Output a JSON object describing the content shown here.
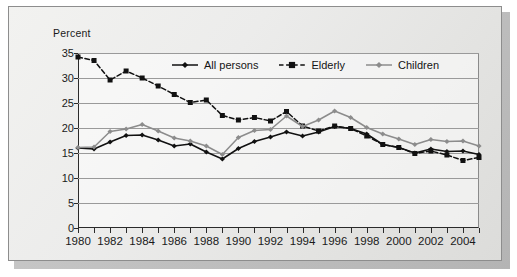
{
  "figure": {
    "y_axis_title": "Percent"
  },
  "legend": {
    "position": "top-center-inside",
    "items": [
      {
        "label": "All persons",
        "color": "#111111",
        "dash": "solid",
        "marker": "diamond"
      },
      {
        "label": "Elderly",
        "color": "#111111",
        "dash": "dashed",
        "marker": "square"
      },
      {
        "label": "Children",
        "color": "#8c8c8c",
        "dash": "solid",
        "marker": "diamond"
      }
    ]
  },
  "chart_data": {
    "type": "line",
    "title": "",
    "xlabel": "",
    "ylabel": "Percent",
    "xlim": [
      1980,
      2005
    ],
    "ylim": [
      0,
      35
    ],
    "ytick_step": 5,
    "grid": true,
    "xtick_every": 1,
    "xlabel_every": 2,
    "x": [
      1980,
      1981,
      1982,
      1983,
      1984,
      1985,
      1986,
      1987,
      1988,
      1989,
      1990,
      1991,
      1992,
      1993,
      1994,
      1995,
      1996,
      1997,
      1998,
      1999,
      2000,
      2001,
      2002,
      2003,
      2004,
      2005
    ],
    "yticks": [
      0,
      5,
      10,
      15,
      20,
      25,
      30,
      35
    ],
    "xticks": [
      1980,
      1981,
      1982,
      1983,
      1984,
      1985,
      1986,
      1987,
      1988,
      1989,
      1990,
      1991,
      1992,
      1993,
      1994,
      1995,
      1996,
      1997,
      1998,
      1999,
      2000,
      2001,
      2002,
      2003,
      2004,
      2005
    ],
    "xtick_labels": [
      "1980",
      "",
      "1982",
      "",
      "1984",
      "",
      "1986",
      "",
      "1988",
      "",
      "1990",
      "",
      "1992",
      "",
      "1994",
      "",
      "1996",
      "",
      "1998",
      "",
      "2000",
      "",
      "2002",
      "",
      "2004",
      ""
    ],
    "series": [
      {
        "name": "All persons",
        "color": "#111111",
        "dash": "solid",
        "marker": "diamond",
        "values": [
          16.0,
          15.8,
          17.2,
          18.5,
          18.6,
          17.6,
          16.4,
          16.8,
          15.2,
          13.8,
          15.9,
          17.3,
          18.2,
          19.2,
          18.4,
          19.2,
          20.3,
          19.9,
          18.8,
          16.7,
          16.1,
          15.0,
          15.8,
          15.3,
          15.4,
          14.7
        ],
        "units": "percent"
      },
      {
        "name": "Elderly",
        "color": "#111111",
        "dash": "dashed",
        "marker": "square",
        "values": [
          34.2,
          33.5,
          29.6,
          31.4,
          30.0,
          28.4,
          26.7,
          25.1,
          25.6,
          22.5,
          21.6,
          22.1,
          21.4,
          23.3,
          20.4,
          19.4,
          20.4,
          19.9,
          18.4,
          16.7,
          16.1,
          14.9,
          15.4,
          14.6,
          13.5,
          14.1
        ],
        "units": "percent"
      },
      {
        "name": "Children",
        "color": "#8c8c8c",
        "dash": "solid",
        "marker": "diamond",
        "values": [
          16.1,
          16.2,
          19.3,
          19.8,
          20.7,
          19.4,
          18.0,
          17.4,
          16.4,
          14.7,
          18.1,
          19.5,
          19.7,
          22.4,
          20.3,
          21.6,
          23.4,
          22.1,
          20.1,
          18.8,
          17.8,
          16.7,
          17.7,
          17.3,
          17.4,
          16.4
        ],
        "units": "percent"
      }
    ]
  }
}
